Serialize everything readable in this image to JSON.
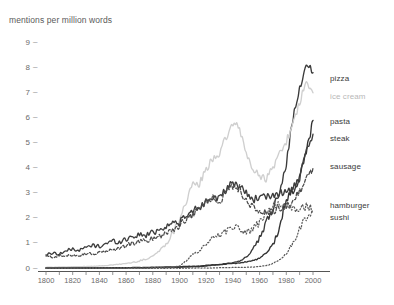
{
  "chart_data": {
    "type": "line",
    "title": "mentions per million words",
    "xlabel": "",
    "ylabel": "mentions per million words",
    "xlim": [
      1795,
      2005
    ],
    "ylim": [
      0,
      9.4
    ],
    "grid": false,
    "legend_position": "right-inline-labels",
    "x_ticks": [
      "1800",
      "1820",
      "1840",
      "1860",
      "1880",
      "1900",
      "1920",
      "1940",
      "1960",
      "1980",
      "2000"
    ],
    "x_tick_values": [
      1800,
      1820,
      1840,
      1860,
      1880,
      1900,
      1920,
      1940,
      1960,
      1980,
      2000
    ],
    "y_ticks": [
      "0",
      "1",
      "2",
      "3",
      "4",
      "5",
      "6",
      "7",
      "8",
      "9"
    ],
    "y_tick_values": [
      0,
      1,
      2,
      3,
      4,
      5,
      6,
      7,
      8,
      9
    ],
    "x": [
      1800,
      1805,
      1810,
      1815,
      1820,
      1825,
      1830,
      1835,
      1840,
      1845,
      1850,
      1855,
      1860,
      1865,
      1870,
      1875,
      1880,
      1885,
      1890,
      1895,
      1900,
      1905,
      1910,
      1915,
      1920,
      1925,
      1930,
      1935,
      1940,
      1945,
      1950,
      1955,
      1960,
      1965,
      1970,
      1975,
      1980,
      1985,
      1990,
      1995,
      2000
    ],
    "series": [
      {
        "name": "pizza",
        "color": "#3b3b3b",
        "style": "solid",
        "label_y_value": 7.55,
        "values": [
          0.02,
          0.02,
          0.02,
          0.02,
          0.02,
          0.02,
          0.02,
          0.02,
          0.02,
          0.02,
          0.02,
          0.02,
          0.02,
          0.03,
          0.03,
          0.03,
          0.03,
          0.04,
          0.04,
          0.05,
          0.05,
          0.06,
          0.07,
          0.08,
          0.1,
          0.13,
          0.16,
          0.2,
          0.24,
          0.3,
          0.45,
          0.75,
          1.2,
          1.8,
          2.4,
          3.1,
          4.2,
          6.0,
          7.1,
          8.2,
          7.8
        ]
      },
      {
        "name": "ice cream",
        "color": "#cfcfcf",
        "style": "solid",
        "label_y_value": 6.85,
        "values": [
          0.05,
          0.05,
          0.06,
          0.06,
          0.07,
          0.07,
          0.08,
          0.09,
          0.1,
          0.12,
          0.14,
          0.17,
          0.2,
          0.24,
          0.3,
          0.38,
          0.5,
          0.7,
          1.0,
          1.4,
          2.0,
          2.7,
          3.3,
          3.4,
          3.9,
          4.4,
          4.6,
          5.2,
          5.8,
          5.55,
          4.6,
          3.9,
          3.7,
          3.6,
          4.0,
          4.6,
          5.1,
          5.7,
          6.6,
          7.4,
          7.0
        ]
      },
      {
        "name": "pasta",
        "color": "#333333",
        "style": "solid",
        "label_y_value": 5.85,
        "values": [
          0.02,
          0.02,
          0.02,
          0.02,
          0.02,
          0.02,
          0.02,
          0.02,
          0.02,
          0.03,
          0.03,
          0.03,
          0.03,
          0.04,
          0.04,
          0.04,
          0.05,
          0.05,
          0.06,
          0.06,
          0.07,
          0.08,
          0.09,
          0.1,
          0.12,
          0.14,
          0.16,
          0.18,
          0.2,
          0.22,
          0.26,
          0.32,
          0.4,
          0.6,
          0.95,
          1.6,
          2.8,
          3.05,
          3.6,
          4.7,
          5.9
        ]
      },
      {
        "name": "steak",
        "color": "#3d3d3d",
        "style": "solid",
        "label_y_value": 5.15,
        "values": [
          0.55,
          0.62,
          0.58,
          0.7,
          0.78,
          0.72,
          0.85,
          0.92,
          0.88,
          1.0,
          1.1,
          1.05,
          1.18,
          1.28,
          1.35,
          1.32,
          1.45,
          1.55,
          1.7,
          1.8,
          1.85,
          2.05,
          2.3,
          2.45,
          2.7,
          2.9,
          2.75,
          3.15,
          3.4,
          3.3,
          3.0,
          2.75,
          2.85,
          2.8,
          2.95,
          3.0,
          3.05,
          3.2,
          3.6,
          4.6,
          5.35
        ]
      },
      {
        "name": "sausage",
        "color": "#4a4a4a",
        "style": "dashed",
        "label_y_value": 4.05,
        "values": [
          0.5,
          0.45,
          0.52,
          0.48,
          0.55,
          0.52,
          0.6,
          0.58,
          0.62,
          0.7,
          0.75,
          0.8,
          0.92,
          1.0,
          1.08,
          1.1,
          1.2,
          1.3,
          1.45,
          1.55,
          1.7,
          1.95,
          2.2,
          2.4,
          2.65,
          2.85,
          2.7,
          3.05,
          3.3,
          3.2,
          2.7,
          2.4,
          2.3,
          2.2,
          2.25,
          2.35,
          2.5,
          2.7,
          3.1,
          3.6,
          4.0
        ]
      },
      {
        "name": "hamburger",
        "color": "#5a5a5a",
        "style": "dotted",
        "label_y_value": 2.5,
        "values": [
          0.02,
          0.02,
          0.02,
          0.02,
          0.02,
          0.02,
          0.02,
          0.02,
          0.02,
          0.02,
          0.02,
          0.02,
          0.02,
          0.02,
          0.02,
          0.02,
          0.03,
          0.03,
          0.04,
          0.05,
          0.1,
          0.3,
          0.55,
          0.7,
          0.95,
          1.25,
          1.35,
          1.5,
          1.7,
          1.6,
          1.45,
          1.55,
          1.85,
          2.2,
          2.55,
          2.55,
          2.45,
          2.4,
          2.4,
          2.45,
          2.35
        ]
      },
      {
        "name": "sushi",
        "color": "#5a5a5a",
        "style": "dotted",
        "label_y_value": 2.0,
        "values": [
          0.01,
          0.01,
          0.01,
          0.01,
          0.01,
          0.01,
          0.01,
          0.01,
          0.01,
          0.01,
          0.01,
          0.01,
          0.01,
          0.01,
          0.01,
          0.01,
          0.01,
          0.01,
          0.01,
          0.01,
          0.01,
          0.01,
          0.02,
          0.02,
          0.02,
          0.02,
          0.03,
          0.03,
          0.04,
          0.04,
          0.05,
          0.06,
          0.08,
          0.12,
          0.2,
          0.35,
          0.6,
          1.0,
          1.55,
          2.05,
          2.25
        ]
      }
    ]
  }
}
